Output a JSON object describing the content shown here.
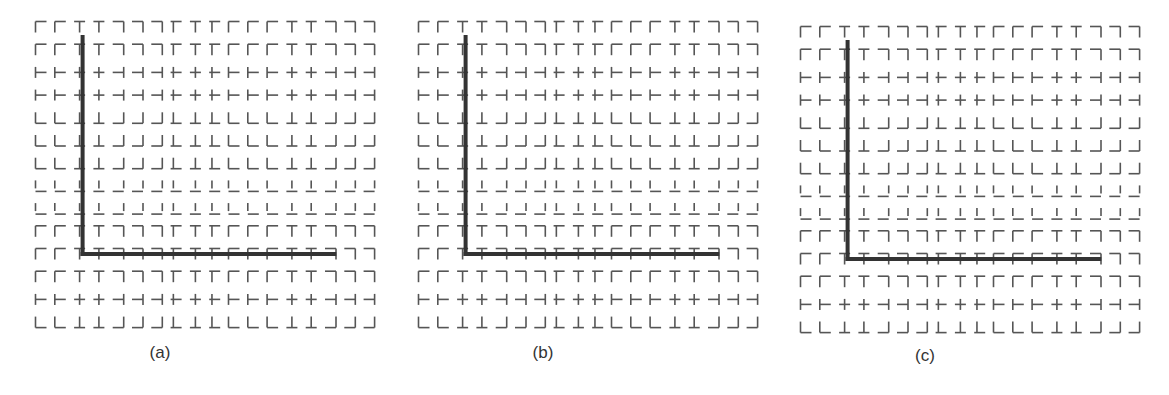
{
  "figure": {
    "panels": [
      {
        "id": "a",
        "label": "(a)",
        "origin_x": 41,
        "origin_y": 27,
        "caption_x": 160,
        "caption_y": 343
      },
      {
        "id": "b",
        "label": "(b)",
        "origin_x": 424,
        "origin_y": 27,
        "caption_x": 543,
        "caption_y": 343
      },
      {
        "id": "c",
        "label": "(c)",
        "origin_x": 806,
        "origin_y": 32,
        "caption_x": 925,
        "caption_y": 346
      }
    ],
    "grid": {
      "cols": 18,
      "rows": 14,
      "col_pitch": 19.3,
      "row_pitch": 22.7,
      "glyph_size": 11,
      "stroke_color": "#555555",
      "axis_color": "#333333",
      "axis_col_index": 2,
      "axis_row_index": 10,
      "axis_end_col_index": 15.3
    },
    "row_horizontal_positions": [
      "top",
      "top",
      "mid",
      "mid",
      "bottom",
      "bottom",
      "bottom",
      "bottom",
      "bottom",
      "top",
      "top",
      "top",
      "mid",
      "bottom"
    ],
    "row_horizontal_visible": [
      true,
      true,
      true,
      true,
      true,
      true,
      true,
      true,
      true,
      true,
      true,
      true,
      true,
      true
    ],
    "row_vertical_extent": [
      "low",
      "low",
      "full",
      "full",
      "high",
      "high",
      "full",
      "split",
      "split",
      "low",
      "low",
      "low",
      "full",
      "high"
    ],
    "col_vertical_positions": [
      "left",
      "left",
      "center",
      "center",
      "right",
      "right",
      "right",
      "center-left",
      "center",
      "center-left",
      "left",
      "left",
      "left",
      "center",
      "center",
      "right",
      "right",
      "right"
    ]
  }
}
